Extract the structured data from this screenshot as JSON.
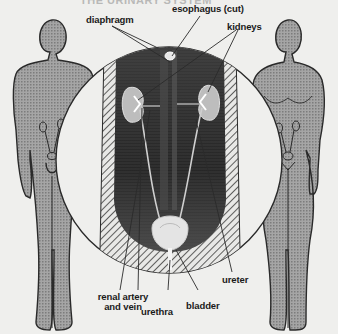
{
  "title": "THE URINARY SYSTEM",
  "labels": {
    "diaphragm": "diaphragm",
    "esophagus": "esophagus (cut)",
    "kidneys": "kidneys",
    "renal_artery_line1": "renal artery",
    "renal_artery_line2": "and vein",
    "urethra": "urethra",
    "bladder": "bladder",
    "ureter": "ureter"
  },
  "figures": [
    {
      "name": "male figure",
      "position": "left"
    },
    {
      "name": "female figure",
      "position": "right"
    }
  ],
  "colors": {
    "background": "#efefed",
    "figure_fill": "#9a9a9a",
    "outline": "#2a2a2a",
    "torso_dark": "#2e2e2e",
    "hatch": "#3a3a3a"
  }
}
